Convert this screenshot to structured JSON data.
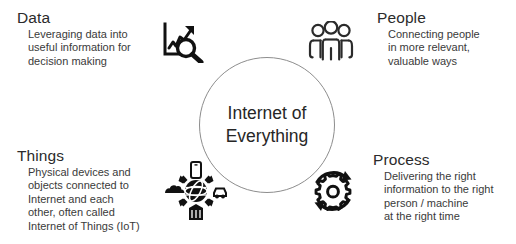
{
  "center": {
    "label": "Internet of\nEverything",
    "shape": "circle",
    "stroke_color": "#8d8d8d"
  },
  "quadrants": [
    {
      "key": "data",
      "title": "Data",
      "lines": [
        "Leveraging data into",
        "useful information for",
        "decision making"
      ],
      "icon": "chart-magnifier-icon",
      "position": "top-left"
    },
    {
      "key": "people",
      "title": "People",
      "lines": [
        "Connecting people",
        "in more relevant,",
        "valuable ways"
      ],
      "icon": "people-group-icon",
      "position": "top-right"
    },
    {
      "key": "things",
      "title": "Things",
      "lines": [
        "Physical devices and",
        "objects connected to",
        "Internet and each",
        "other, often called",
        "Internet of Things (IoT)"
      ],
      "icon": "connected-devices-icon",
      "position": "bottom-left"
    },
    {
      "key": "process",
      "title": "Process",
      "lines": [
        "Delivering the right",
        "information to the right",
        "person / machine",
        "at the right time"
      ],
      "icon": "gear-cycle-icon",
      "position": "bottom-right"
    }
  ],
  "colors": {
    "background": "#ffffff",
    "title_text": "#2b2b2b",
    "body_text": "#3a3a3a",
    "center_text": "#262626",
    "icon": "#111111"
  }
}
